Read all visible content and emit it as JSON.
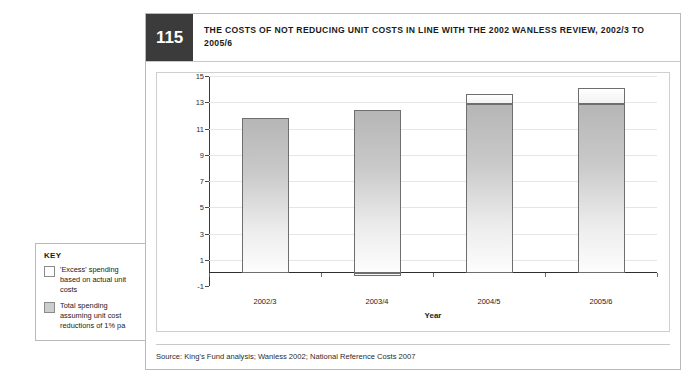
{
  "figure": {
    "number": "115",
    "title": "THE COSTS OF NOT REDUCING UNIT COSTS IN LINE WITH THE 2002 WANLESS REVIEW, 2002/3 TO 2005/6",
    "source": "Source: King's Fund analysis; Wanless 2002; National Reference Costs 2007"
  },
  "key": {
    "title": "KEY",
    "items": [
      {
        "label": "'Excess' spending based on actual unit costs",
        "swatch": "white",
        "color": "#fdfdfd"
      },
      {
        "label": "Total spending assuming unit cost reductions of 1% pa",
        "swatch": "grey",
        "color": "#cdcdcd"
      }
    ]
  },
  "chart_data": {
    "type": "bar",
    "stacked": true,
    "title": "THE COSTS OF NOT REDUCING UNIT COSTS IN LINE WITH THE 2002 WANLESS REVIEW, 2002/3 TO 2005/6",
    "xlabel": "Year",
    "ylabel": "£ billion",
    "categories": [
      "2002/3",
      "2003/4",
      "2004/5",
      "2005/6"
    ],
    "ylim": [
      -1,
      15
    ],
    "yticks": [
      -1,
      1,
      3,
      5,
      7,
      9,
      11,
      13,
      15
    ],
    "grid": true,
    "legend_position": "external-left",
    "series": [
      {
        "name": "Total spending assuming unit cost reductions of 1% pa",
        "color": "#cdcdcd",
        "values": [
          11.8,
          12.4,
          12.9,
          12.9
        ]
      },
      {
        "name": "'Excess' spending based on actual unit costs",
        "color": "#fdfdfd",
        "values": [
          0.0,
          -0.2,
          0.75,
          1.2
        ]
      }
    ],
    "totals": [
      11.8,
      12.4,
      13.65,
      14.1
    ]
  }
}
